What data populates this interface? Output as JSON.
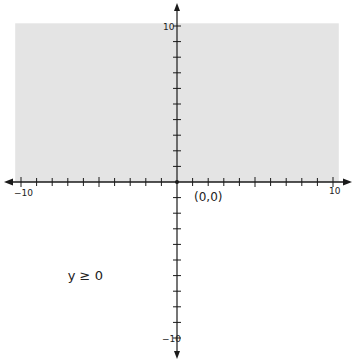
{
  "chart_data": {
    "type": "area",
    "title": "",
    "xlabel": "",
    "ylabel": "",
    "xlim": [
      -10,
      10
    ],
    "ylim": [
      -10,
      10
    ],
    "grid": false,
    "tick_step": 1,
    "tick_labels": {
      "x_min": "−10",
      "x_max": "10",
      "y_max": "10",
      "y_min": "−10"
    },
    "shaded_region": {
      "inequality": "y ≥ 0",
      "x_range": [
        -10.5,
        10.5
      ],
      "y_range": [
        0,
        10.3
      ],
      "color": "#e4e4e4"
    },
    "points": [
      {
        "x": 0,
        "y": 0,
        "label": "(0,0)"
      }
    ],
    "annotations": [
      {
        "text": "y ≥ 0",
        "x": -7,
        "y": -6
      }
    ],
    "axis_color": "#1a1a1a"
  }
}
